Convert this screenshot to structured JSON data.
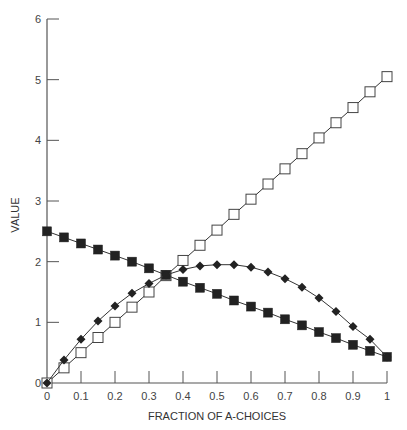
{
  "chart_data": {
    "type": "line",
    "title": "",
    "xlabel": "FRACTION OF A-CHOICES",
    "ylabel": "VALUE",
    "xlim": [
      0,
      1
    ],
    "ylim": [
      0,
      6
    ],
    "grid": false,
    "legend": null,
    "x_ticks": [
      "0",
      "0.1",
      "0.2",
      "0.3",
      "0.4",
      "0.5",
      "0.6",
      "0.7",
      "0.8",
      "0.9",
      "1"
    ],
    "y_ticks": [
      "0",
      "1",
      "2",
      "3",
      "4",
      "5",
      "6"
    ],
    "x": [
      0,
      0.05,
      0.1,
      0.15,
      0.2,
      0.25,
      0.3,
      0.35,
      0.4,
      0.45,
      0.5,
      0.55,
      0.6,
      0.65,
      0.7,
      0.75,
      0.8,
      0.85,
      0.9,
      0.95,
      1
    ],
    "series": [
      {
        "name": "open-squares",
        "marker": "open-square",
        "values": [
          0,
          0.25,
          0.5,
          0.75,
          1.0,
          1.25,
          1.5,
          1.77,
          2.02,
          2.27,
          2.52,
          2.78,
          3.03,
          3.28,
          3.53,
          3.78,
          4.04,
          4.29,
          4.54,
          4.8,
          5.05
        ]
      },
      {
        "name": "filled-squares",
        "marker": "filled-square",
        "values": [
          2.5,
          2.4,
          2.3,
          2.2,
          2.1,
          2.0,
          1.89,
          1.78,
          1.67,
          1.57,
          1.47,
          1.36,
          1.26,
          1.16,
          1.05,
          0.95,
          0.84,
          0.74,
          0.63,
          0.53,
          0.43
        ]
      },
      {
        "name": "filled-diamonds",
        "marker": "filled-diamond",
        "values": [
          0,
          0.38,
          0.72,
          1.02,
          1.27,
          1.48,
          1.64,
          1.78,
          1.87,
          1.93,
          1.95,
          1.95,
          1.91,
          1.83,
          1.72,
          1.58,
          1.4,
          1.18,
          0.93,
          0.72,
          0.43
        ]
      }
    ]
  },
  "colors": {
    "axis": "#555555",
    "line": "#333333",
    "marker_fill": "#222222",
    "open_marker_fill": "#ffffff"
  }
}
